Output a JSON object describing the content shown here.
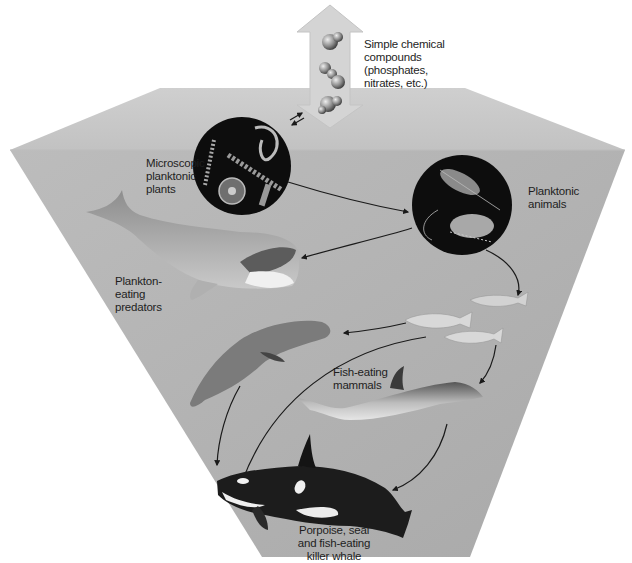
{
  "diagram": {
    "type": "marine food web (inverted pyramid)",
    "colors": {
      "water_face": "#b2b2b2",
      "water_top": "#c8c8c8",
      "arrow_fill": "#d2d2d2",
      "circle_bg": "#0d0d0d",
      "label_text": "#1e1e1e"
    },
    "nodes": {
      "nutrients": {
        "lines": [
          "Simple chemical",
          "compounds",
          "(phosphates,",
          "nitrates, etc.)"
        ],
        "icon": "molecule-icon"
      },
      "phytoplankton": {
        "lines": [
          "Microscopic",
          "planktonic",
          "plants"
        ],
        "icon": "phytoplankton-circle"
      },
      "zooplankton": {
        "lines": [
          "Planktonic",
          "animals"
        ],
        "icon": "zooplankton-circle"
      },
      "baleen_whale": {
        "lines": [
          "Plankton-",
          "eating",
          "predators"
        ],
        "icon": "whale-icon"
      },
      "fish": {
        "lines": [],
        "icon": "fish-icon"
      },
      "seal": {
        "lines": [],
        "icon": "seal-icon"
      },
      "fish_eating_mammals": {
        "lines": [
          "Fish-eating",
          "mammals"
        ],
        "icon": "dolphin-icon"
      },
      "top_predator": {
        "lines": [
          "Porpoise, seal",
          "and fish-eating",
          "killer whale"
        ],
        "icon": "orca-icon"
      }
    },
    "edges": [
      {
        "from": "nutrients",
        "to": "phytoplankton",
        "bidirectional": true
      },
      {
        "from": "phytoplankton",
        "to": "zooplankton"
      },
      {
        "from": "zooplankton",
        "to": "baleen_whale"
      },
      {
        "from": "zooplankton",
        "to": "fish"
      },
      {
        "from": "fish",
        "to": "seal"
      },
      {
        "from": "fish",
        "to": "top_predator"
      },
      {
        "from": "fish",
        "to": "fish_eating_mammals"
      },
      {
        "from": "seal",
        "to": "top_predator"
      },
      {
        "from": "fish_eating_mammals",
        "to": "top_predator"
      }
    ]
  }
}
